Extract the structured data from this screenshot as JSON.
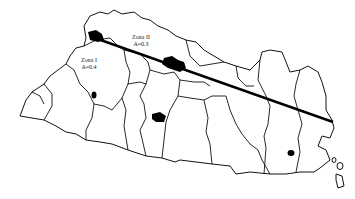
{
  "map": {
    "subject": "El Salvador seismic zonation map",
    "zones": [
      {
        "name": "Zona I",
        "coefficient": "A=0.4"
      },
      {
        "name": "Zona II",
        "coefficient": "A=0.3"
      }
    ],
    "boundary_line": {
      "from": [
        92,
        37
      ],
      "to": [
        333,
        122
      ],
      "color": "#000000"
    },
    "colors": {
      "background": "#ffffff",
      "lines": "#111111",
      "water_bodies": "#000000"
    }
  }
}
